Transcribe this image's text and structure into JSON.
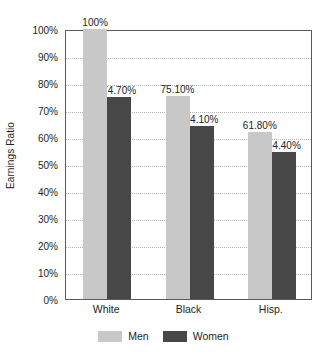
{
  "chart_data": {
    "type": "bar",
    "title": "",
    "subtitle": "",
    "xlabel": "",
    "ylabel": "Earnings Ratio",
    "categories": [
      "White",
      "Black",
      "Hisp."
    ],
    "series": [
      {
        "name": "Men",
        "color": "#c8c8c8",
        "values": [
          100,
          74.7,
          75.1
        ],
        "data_labels": [
          "100%",
          "75.10%",
          "61.80%"
        ]
      },
      {
        "name": "Women",
        "color": "#474747",
        "values": [
          74.7,
          64.1,
          54.4
        ],
        "data_labels": [
          "74.70%",
          "64.10%",
          "54.40%"
        ]
      }
    ],
    "bars": [
      {
        "category": "White",
        "series": "Men",
        "value": 100,
        "label": "100%"
      },
      {
        "category": "White",
        "series": "Women",
        "value": 74.7,
        "label": "74.70%"
      },
      {
        "category": "Black",
        "series": "Men",
        "value": 75.1,
        "label": "75.10%"
      },
      {
        "category": "Black",
        "series": "Women",
        "value": 64.1,
        "label": "64.10%"
      },
      {
        "category": "Hisp.",
        "series": "Men",
        "value": 61.8,
        "label": "61.80%"
      },
      {
        "category": "Hisp.",
        "series": "Women",
        "value": 54.4,
        "label": "54.40%"
      }
    ],
    "ylim": [
      0,
      100
    ],
    "y_tick_values": [
      0,
      10,
      20,
      30,
      40,
      50,
      60,
      70,
      80,
      90,
      100
    ],
    "y_tick_labels": [
      "0%",
      "10%",
      "20%",
      "30%",
      "40%",
      "50%",
      "60%",
      "70%",
      "80%",
      "90%",
      "100%"
    ],
    "grid": true,
    "grid_axis": "y",
    "legend_position": "bottom",
    "legend_entries": [
      {
        "label": "Men",
        "color": "#c8c8c8"
      },
      {
        "label": "Women",
        "color": "#474747"
      }
    ],
    "colors": {
      "men": "#c8c8c8",
      "women": "#474747",
      "axis": "#5a5a5a",
      "grid": "#b5b5b5",
      "text": "#231f20",
      "background": "#ffffff"
    }
  }
}
